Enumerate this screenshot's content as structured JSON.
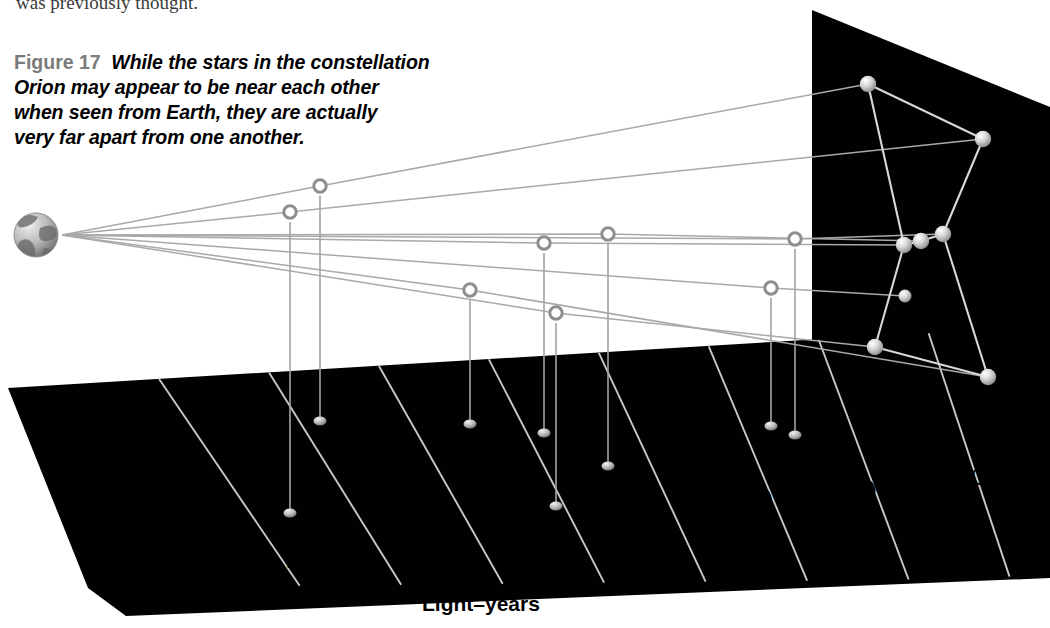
{
  "figure": {
    "cropped_text_above": "was previously thought.",
    "label": "Figure 17",
    "caption_lines": [
      "While the stars in the constellation",
      "Orion may appear to be near each other",
      "when seen from Earth, they are actually",
      "very far apart from one another."
    ],
    "label_color": "#7b7b7b",
    "caption_color": "#000000"
  },
  "axis": {
    "title": "Light–years",
    "title_pos": {
      "x": 422,
      "y": 592
    },
    "ticks": [
      {
        "label": "0",
        "value": 0,
        "x": 186,
        "y": 558,
        "rot": -16
      },
      {
        "label": "200",
        "value": 200,
        "x": 281,
        "y": 548,
        "rot": -16
      },
      {
        "label": "400",
        "value": 400,
        "x": 396,
        "y": 535,
        "rot": -16
      },
      {
        "label": "600",
        "value": 600,
        "x": 509,
        "y": 523,
        "rot": -16
      },
      {
        "label": "800",
        "value": 800,
        "x": 618,
        "y": 511,
        "rot": -16
      },
      {
        "label": "1,000",
        "value": 1000,
        "x": 713,
        "y": 499,
        "rot": -16
      },
      {
        "label": "1,200",
        "value": 1200,
        "x": 829,
        "y": 487,
        "rot": -16
      },
      {
        "label": "1,400",
        "value": 1400,
        "x": 938,
        "y": 475,
        "rot": -16
      }
    ]
  },
  "colors": {
    "plane_fill": "#010101",
    "backdrop_fill": "#010101",
    "grid_line": "#c8c8c8",
    "sight_line": "#aaaaaa",
    "constellation_line": "#d6d6d6",
    "stem_line": "#a8a8a8",
    "ring_stroke": "#8e8e8e",
    "star_fill": "#d9d9d9",
    "background": "#ffffff"
  },
  "earth": {
    "name": "Earth",
    "cx": 36,
    "cy": 235,
    "r": 22,
    "apex_x": 62,
    "apex_y": 235
  },
  "chart_data": {
    "type": "scatter",
    "xlabel": "Light–years",
    "xlim": [
      0,
      1500
    ],
    "grid": true,
    "legend": null,
    "note": "3-D perspective plot: hollow ring = true star position in space; filled blob on floor = projected distance on the Light-years floor; bright sphere on rear black panel = apparent position in the night sky as seen from Earth.",
    "stars": [
      {
        "name": "Betelgeuse",
        "distance_ly": 640,
        "ring": [
          320,
          186
        ],
        "floor": [
          320,
          421
        ],
        "sky": [
          868,
          84
        ],
        "stem_from": [
          320,
          196
        ]
      },
      {
        "name": "Bellatrix",
        "distance_ly": 250,
        "ring": [
          290,
          212
        ],
        "floor": [
          290,
          513
        ],
        "sky": [
          983,
          139
        ],
        "stem_from": [
          290,
          222
        ]
      },
      {
        "name": "Mintaka",
        "distance_ly": 690,
        "ring": [
          544,
          243
        ],
        "floor": [
          544,
          433
        ],
        "sky": [
          904,
          245
        ],
        "stem_from": [
          544,
          253
        ]
      },
      {
        "name": "Alnilam",
        "distance_ly": 1340,
        "ring": [
          608,
          234
        ],
        "floor": [
          608,
          466
        ],
        "sky": [
          921,
          241
        ],
        "stem_from": [
          608,
          244
        ]
      },
      {
        "name": "Alnitak",
        "distance_ly": 800,
        "ring": [
          795,
          239
        ],
        "floor": [
          795,
          435
        ],
        "sky": [
          943,
          234
        ],
        "stem_from": [
          795,
          249
        ]
      },
      {
        "name": "Nair al Saif",
        "distance_ly": 1300,
        "ring": [
          771,
          288
        ],
        "floor": [
          771,
          426
        ],
        "sky": [
          905,
          296
        ],
        "stem_from": [
          771,
          298
        ]
      },
      {
        "name": "Saiph",
        "distance_ly": 720,
        "ring": [
          556,
          313
        ],
        "floor": [
          556,
          506
        ],
        "sky": [
          875,
          347
        ],
        "stem_from": [
          556,
          323
        ]
      },
      {
        "name": "Rigel",
        "distance_ly": 860,
        "ring": [
          470,
          290
        ],
        "floor": [
          470,
          424
        ],
        "sky": [
          988,
          377
        ],
        "stem_from": [
          470,
          300
        ]
      }
    ],
    "constellation_links": [
      [
        "Betelgeuse",
        "Bellatrix"
      ],
      [
        "Betelgeuse",
        "Mintaka"
      ],
      [
        "Bellatrix",
        "Alnitak"
      ],
      [
        "Mintaka",
        "Alnilam"
      ],
      [
        "Alnilam",
        "Alnitak"
      ],
      [
        "Mintaka",
        "Saiph"
      ],
      [
        "Alnitak",
        "Rigel"
      ],
      [
        "Saiph",
        "Rigel"
      ]
    ]
  }
}
